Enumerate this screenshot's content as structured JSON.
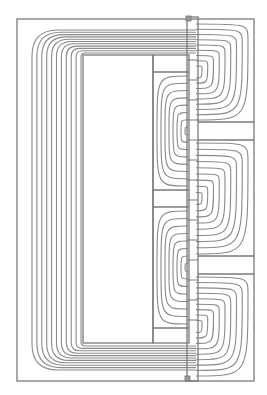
{
  "diagram": {
    "type": "magnetic-flux-line-plot",
    "canvas": {
      "width": 267,
      "height": 395,
      "background": "#ffffff"
    },
    "colors": {
      "geometry": "#7a7a7a",
      "flux_lines": "#8a8a8a",
      "marker": "#9a9a9a"
    },
    "outer_boundary": {
      "x": 17,
      "y": 19,
      "w": 237,
      "h": 362
    },
    "core_window": {
      "x": 83,
      "y": 55,
      "w": 70,
      "h": 288
    },
    "coil_column": {
      "x": 153,
      "y": 55,
      "w": 36,
      "h": 288
    },
    "coil_dividers_y": [
      72,
      190,
      207,
      328
    ],
    "air_gap_strip": {
      "x": 187,
      "y": 17,
      "w": 11,
      "h": 364
    },
    "right_bars": [
      {
        "y1": 122,
        "y2": 140,
        "x1": 198,
        "x2": 254
      },
      {
        "y1": 256,
        "y2": 274,
        "x1": 198,
        "x2": 254
      }
    ],
    "markers": [
      {
        "name": "top-marker",
        "x": 186,
        "y": 16,
        "w": 5,
        "h": 5
      },
      {
        "name": "bottom-marker",
        "x": 185,
        "y": 376,
        "w": 5,
        "h": 5
      }
    ],
    "flux_loop_count": 11,
    "strip_hatch_count": 14
  }
}
